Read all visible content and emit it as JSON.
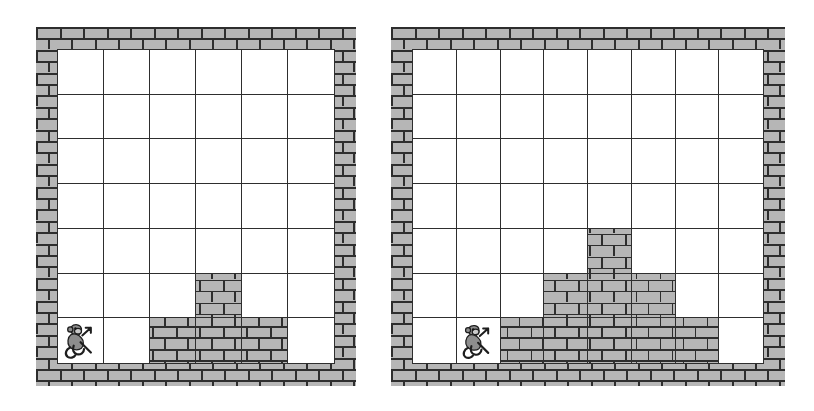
{
  "scene": {
    "title": "Two brick-wall grid worlds with monkey agent",
    "background_color": "#ffffff",
    "wall_color": "#b6b6b6",
    "mortar_color": "#2e2e2e",
    "empty_cell_color": "#ffffff",
    "agent_icon": "monkey-icon"
  },
  "panels": [
    {
      "name": "left-grid-world",
      "label": "Left grid world",
      "x": 36,
      "y": 27,
      "width": 320,
      "height": 359,
      "wall_thickness_left": 22,
      "wall_thickness_right": 22,
      "wall_thickness_top": 23,
      "wall_thickness_bottom": 23,
      "columns": 6,
      "rows": 7,
      "agent": {
        "icon": "monkey-icon",
        "row": 6,
        "column": 0
      },
      "cells": [
        [
          "empty",
          "empty",
          "empty",
          "empty",
          "empty",
          "empty"
        ],
        [
          "empty",
          "empty",
          "empty",
          "empty",
          "empty",
          "empty"
        ],
        [
          "empty",
          "empty",
          "empty",
          "empty",
          "empty",
          "empty"
        ],
        [
          "empty",
          "empty",
          "empty",
          "empty",
          "empty",
          "empty"
        ],
        [
          "empty",
          "empty",
          "empty",
          "empty",
          "empty",
          "empty"
        ],
        [
          "empty",
          "empty",
          "empty",
          "brick",
          "empty",
          "empty"
        ],
        [
          "agent",
          "empty",
          "brick",
          "brick",
          "brick",
          "empty"
        ]
      ]
    },
    {
      "name": "right-grid-world",
      "label": "Right grid world",
      "x": 391,
      "y": 27,
      "width": 394,
      "height": 359,
      "wall_thickness_left": 22,
      "wall_thickness_right": 22,
      "wall_thickness_top": 23,
      "wall_thickness_bottom": 23,
      "columns": 8,
      "rows": 7,
      "agent": {
        "icon": "monkey-icon",
        "row": 6,
        "column": 1
      },
      "cells": [
        [
          "empty",
          "empty",
          "empty",
          "empty",
          "empty",
          "empty",
          "empty",
          "empty"
        ],
        [
          "empty",
          "empty",
          "empty",
          "empty",
          "empty",
          "empty",
          "empty",
          "empty"
        ],
        [
          "empty",
          "empty",
          "empty",
          "empty",
          "empty",
          "empty",
          "empty",
          "empty"
        ],
        [
          "empty",
          "empty",
          "empty",
          "empty",
          "empty",
          "empty",
          "empty",
          "empty"
        ],
        [
          "empty",
          "empty",
          "empty",
          "empty",
          "brick",
          "empty",
          "empty",
          "empty"
        ],
        [
          "empty",
          "empty",
          "empty",
          "brick",
          "brick",
          "brick",
          "empty",
          "empty"
        ],
        [
          "empty",
          "agent",
          "brick",
          "brick",
          "brick",
          "brick",
          "brick",
          "empty"
        ]
      ]
    }
  ]
}
